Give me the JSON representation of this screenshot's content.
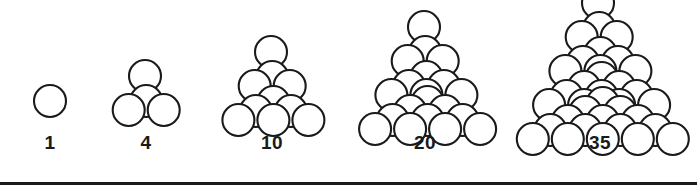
{
  "figure": {
    "name": "tetrahedral-number-sphere-stacks",
    "background_color": "#ffffff",
    "stroke_color": "#1a1a1a",
    "fill_color": "#ffffff",
    "stroke_width": 2.1,
    "sphere_radius": 16,
    "clusters": [
      {
        "label": "1",
        "layers": 1,
        "count": 1,
        "label_x": 50,
        "label_y": 133,
        "apex_x": 50,
        "apex_y": 101
      },
      {
        "label": "4",
        "layers": 2,
        "count": 4,
        "label_x": 146,
        "label_y": 133,
        "apex_x": 145,
        "apex_y": 76
      },
      {
        "label": "10",
        "layers": 3,
        "count": 10,
        "label_x": 272,
        "label_y": 133,
        "apex_x": 271,
        "apex_y": 52
      },
      {
        "label": "20",
        "layers": 4,
        "count": 20,
        "label_x": 425,
        "label_y": 133,
        "apex_x": 424,
        "apex_y": 27
      },
      {
        "label": "35",
        "layers": 5,
        "count": 35,
        "label_x": 600,
        "label_y": 133,
        "apex_x": 598,
        "apex_y": 3
      }
    ],
    "rule": {
      "y": 182,
      "x": 0,
      "width": 697,
      "height": 3
    }
  },
  "chart_data": {
    "type": "diagram",
    "title": "",
    "subtitle": "",
    "categories": [
      "1",
      "4",
      "10",
      "20",
      "35"
    ],
    "values": [
      1,
      4,
      10,
      20,
      35
    ],
    "series": [
      {
        "name": "tetrahedral number",
        "values": [
          1,
          4,
          10,
          20,
          35
        ]
      },
      {
        "name": "stack layers",
        "values": [
          1,
          2,
          3,
          4,
          5
        ]
      }
    ],
    "xlabel": "",
    "ylabel": "",
    "annotations": [
      "1",
      "4",
      "10",
      "20",
      "35"
    ],
    "grid": false,
    "legend": "none"
  }
}
